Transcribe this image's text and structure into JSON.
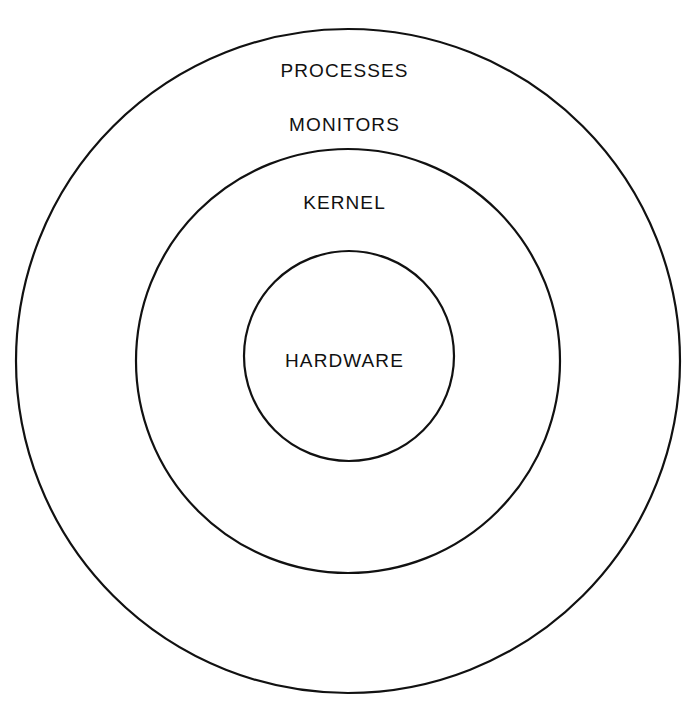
{
  "diagram": {
    "background_color": "#ffffff",
    "stroke_color": "#111111",
    "text_color": "#111111",
    "layers": [
      {
        "name": "processes",
        "label": "PROCESSES",
        "ring_index": 1,
        "circle": {
          "cx": 348,
          "cy": 361,
          "r": 332,
          "stroke_width": 2.2
        },
        "label_position": {
          "x": 347,
          "y": 71
        }
      },
      {
        "name": "monitors",
        "label": "MONITORS",
        "ring_index": 2,
        "label_position": {
          "x": 347,
          "y": 125
        }
      },
      {
        "name": "kernel",
        "label": "KERNEL",
        "ring_index": 2,
        "circle": {
          "cx": 348,
          "cy": 361,
          "r": 212,
          "stroke_width": 2.2
        },
        "label_position": {
          "x": 346,
          "y": 203
        }
      },
      {
        "name": "hardware",
        "label": "HARDWARE",
        "ring_index": 3,
        "circle": {
          "cx": 349,
          "cy": 356,
          "r": 105,
          "stroke_width": 2.2
        },
        "label_position": {
          "x": 348,
          "y": 361
        }
      }
    ]
  },
  "chart_data": {
    "type": "diagram",
    "subtype": "concentric-circles",
    "title": "",
    "labels": [
      "PROCESSES",
      "MONITORS",
      "KERNEL",
      "HARDWARE"
    ],
    "nesting_order_outermost_first": [
      "PROCESSES",
      "MONITORS",
      "KERNEL",
      "HARDWARE"
    ],
    "circle_radii_px": [
      332,
      212,
      105
    ],
    "circle_centers_px": [
      [
        348,
        361
      ],
      [
        348,
        361
      ],
      [
        349,
        356
      ]
    ]
  }
}
